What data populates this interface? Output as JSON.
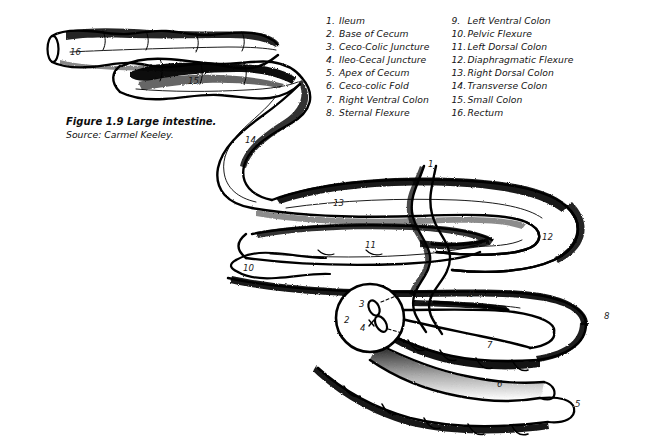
{
  "figure": {
    "caption_title": "Figure 1.9 Large intestine.",
    "caption_source": "Source: Carmel Keeley.",
    "ink_color": "#000000",
    "background_color": "#ffffff"
  },
  "legend": {
    "column1": [
      {
        "num": "1.",
        "label": "Ileum"
      },
      {
        "num": "2.",
        "label": "Base of Cecum"
      },
      {
        "num": "3.",
        "label": "Ceco-Colic Juncture"
      },
      {
        "num": "4.",
        "label": "Ileo-Cecal Juncture"
      },
      {
        "num": "5.",
        "label": "Apex of Cecum"
      },
      {
        "num": "6.",
        "label": "Ceco-colic Fold"
      },
      {
        "num": "7.",
        "label": "Right Ventral Colon"
      },
      {
        "num": "8.",
        "label": "Sternal Flexure"
      }
    ],
    "column2": [
      {
        "num": "9.",
        "label": "Left Ventral Colon"
      },
      {
        "num": "10.",
        "label": "Pelvic Flexure"
      },
      {
        "num": "11.",
        "label": "Left Dorsal Colon"
      },
      {
        "num": "12.",
        "label": "Diaphragmatic Flexure"
      },
      {
        "num": "13.",
        "label": "Right Dorsal Colon"
      },
      {
        "num": "14.",
        "label": "Transverse Colon"
      },
      {
        "num": "15.",
        "label": "Small Colon"
      },
      {
        "num": "16.",
        "label": "Rectum"
      }
    ]
  },
  "callouts": [
    {
      "id": "1",
      "text": "1",
      "x": 428,
      "y": 160
    },
    {
      "id": "2",
      "text": "2",
      "x": 344,
      "y": 316
    },
    {
      "id": "3",
      "text": "3",
      "x": 359,
      "y": 300
    },
    {
      "id": "4",
      "text": "4",
      "x": 360,
      "y": 324
    },
    {
      "id": "5",
      "text": "5",
      "x": 575,
      "y": 400
    },
    {
      "id": "6",
      "text": "6",
      "x": 497,
      "y": 380
    },
    {
      "id": "7",
      "text": "7",
      "x": 487,
      "y": 341
    },
    {
      "id": "8",
      "text": "8",
      "x": 604,
      "y": 312
    },
    {
      "id": "9",
      "text": "9",
      "x": 469,
      "y": 290
    },
    {
      "id": "10",
      "text": "10",
      "x": 243,
      "y": 264
    },
    {
      "id": "11",
      "text": "11",
      "x": 365,
      "y": 241
    },
    {
      "id": "12",
      "text": "12",
      "x": 542,
      "y": 233
    },
    {
      "id": "13",
      "text": "13",
      "x": 333,
      "y": 199
    },
    {
      "id": "14",
      "text": "14",
      "x": 245,
      "y": 136
    },
    {
      "id": "15",
      "text": "15",
      "x": 188,
      "y": 77
    },
    {
      "id": "16",
      "text": "16",
      "x": 70,
      "y": 48
    }
  ]
}
